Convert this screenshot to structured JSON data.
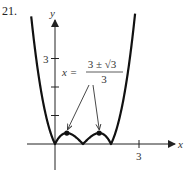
{
  "problem_number": "21.",
  "chart_data": {
    "type": "line",
    "title": "",
    "function": "y = |x^3 - 3x^2 + 2x|",
    "xlabel": "x",
    "ylabel": "y",
    "xlim": [
      -1,
      3.9
    ],
    "ylim": [
      -1,
      4.5
    ],
    "x_ticks": [
      {
        "value": 3,
        "label": "3"
      }
    ],
    "y_ticks": [
      {
        "value": 1,
        "label": ""
      },
      {
        "value": 2,
        "label": ""
      },
      {
        "value": 3,
        "label": "3"
      }
    ],
    "grid": false,
    "zeros": [
      0,
      1,
      2
    ],
    "marked_points": [
      {
        "x": 0.423,
        "y": 0.385
      },
      {
        "x": 1.577,
        "y": 0.385
      }
    ],
    "annotation": {
      "lhs": "x =",
      "numerator": "3 ± √3",
      "denominator": "3",
      "points_to": [
        0.423,
        1.577
      ]
    }
  }
}
